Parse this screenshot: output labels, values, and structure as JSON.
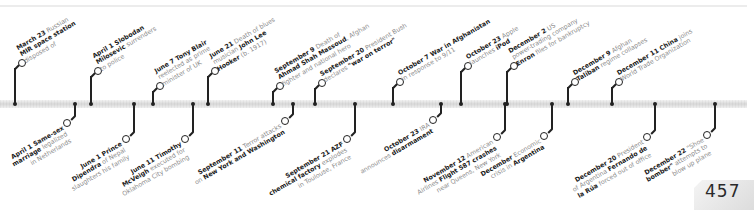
{
  "page": {
    "number": "457"
  },
  "events_above": [
    {
      "date": "March 23",
      "parts": [
        [
          "b",
          "March 23"
        ],
        [
          "t",
          " Russian"
        ],
        [
          "br"
        ],
        [
          "b",
          "MIR space station"
        ],
        [
          "br"
        ],
        [
          "t",
          "disposed of"
        ]
      ]
    },
    {
      "date": "April 1",
      "parts": [
        [
          "b",
          "April 1 Slobodan"
        ],
        [
          "br"
        ],
        [
          "b",
          "Milosevic"
        ],
        [
          "t",
          " surrenders"
        ],
        [
          "br"
        ],
        [
          "t",
          "to police"
        ]
      ]
    },
    {
      "date": "June 7",
      "parts": [
        [
          "b",
          "June 7 Tony Blair"
        ],
        [
          "br"
        ],
        [
          "t",
          "reelected as prime"
        ],
        [
          "br"
        ],
        [
          "t",
          "minister of UK"
        ]
      ]
    },
    {
      "date": "June 21",
      "parts": [
        [
          "b",
          "June 21"
        ],
        [
          "t",
          " Death of blues"
        ],
        [
          "br"
        ],
        [
          "t",
          "musician "
        ],
        [
          "b",
          "John Lee"
        ],
        [
          "br"
        ],
        [
          "b",
          "Hooker"
        ],
        [
          "t",
          " (b. 1917)"
        ]
      ]
    },
    {
      "date": "September 9",
      "parts": [
        [
          "b",
          "September 9"
        ],
        [
          "t",
          " Death of"
        ],
        [
          "br"
        ],
        [
          "b",
          "Ahmad Shah Massoud"
        ],
        [
          "t",
          ", Afghan"
        ],
        [
          "br"
        ],
        [
          "t",
          "fighter and national hero"
        ]
      ]
    },
    {
      "date": "September 20",
      "parts": [
        [
          "b",
          "September 20"
        ],
        [
          "t",
          " President Bush"
        ],
        [
          "br"
        ],
        [
          "t",
          "declares "
        ],
        [
          "b",
          "\"war on terror\""
        ]
      ]
    },
    {
      "date": "October 7",
      "parts": [
        [
          "b",
          "October 7 War in Afghanistan"
        ],
        [
          "br"
        ],
        [
          "t",
          "in response to 9/11"
        ]
      ]
    },
    {
      "date": "October 23",
      "parts": [
        [
          "b",
          "October 23"
        ],
        [
          "t",
          " Apple"
        ],
        [
          "br"
        ],
        [
          "t",
          "launches "
        ],
        [
          "b",
          "iPod"
        ]
      ]
    },
    {
      "date": "December 2",
      "parts": [
        [
          "b",
          "December 2"
        ],
        [
          "t",
          " US"
        ],
        [
          "br"
        ],
        [
          "t",
          "power-trading company"
        ],
        [
          "br"
        ],
        [
          "b",
          "Enron"
        ],
        [
          "t",
          " files for bankruptcy"
        ]
      ]
    },
    {
      "date": "December 9",
      "parts": [
        [
          "b",
          "December 9"
        ],
        [
          "t",
          " Afghan"
        ],
        [
          "br"
        ],
        [
          "b",
          "Taliban"
        ],
        [
          "t",
          " regime collapses"
        ]
      ]
    },
    {
      "date": "December 11",
      "parts": [
        [
          "b",
          "December 11 China"
        ],
        [
          "t",
          " joins"
        ],
        [
          "br"
        ],
        [
          "t",
          "World Trade Organization"
        ]
      ]
    }
  ],
  "events_below": [
    {
      "date": "April 1",
      "parts": [
        [
          "b",
          "April 1 Same-sex"
        ],
        [
          "br"
        ],
        [
          "b",
          "marriage"
        ],
        [
          "t",
          " legalized"
        ],
        [
          "br"
        ],
        [
          "t",
          "in Netherlands"
        ]
      ]
    },
    {
      "date": "June 1",
      "parts": [
        [
          "b",
          "June 1 Prince"
        ],
        [
          "br"
        ],
        [
          "b",
          "Dipendra"
        ],
        [
          "t",
          " of Nepal"
        ],
        [
          "br"
        ],
        [
          "t",
          "slaughters his family"
        ]
      ]
    },
    {
      "date": "June 11",
      "parts": [
        [
          "b",
          "June 11 Timothy"
        ],
        [
          "br"
        ],
        [
          "b",
          "McVeigh"
        ],
        [
          "t",
          " executed for"
        ],
        [
          "br"
        ],
        [
          "t",
          "Oklahoma City bombing"
        ]
      ]
    },
    {
      "date": "September 11",
      "parts": [
        [
          "b",
          "September 11"
        ],
        [
          "t",
          " Terror attacks"
        ],
        [
          "br"
        ],
        [
          "t",
          "on "
        ],
        [
          "b",
          "New York and Washington"
        ]
      ]
    },
    {
      "date": "September 21",
      "parts": [
        [
          "b",
          "September 21 AZF"
        ],
        [
          "br"
        ],
        [
          "b",
          "chemical factory"
        ],
        [
          "t",
          " explodes"
        ],
        [
          "br"
        ],
        [
          "t",
          "in Toulouse, France"
        ]
      ]
    },
    {
      "date": "October 23",
      "parts": [
        [
          "b",
          "October 23"
        ],
        [
          "t",
          " IRA"
        ],
        [
          "br"
        ],
        [
          "t",
          "announces "
        ],
        [
          "b",
          "disarmament"
        ]
      ]
    },
    {
      "date": "November 12",
      "parts": [
        [
          "b",
          "November 12"
        ],
        [
          "t",
          " American"
        ],
        [
          "br"
        ],
        [
          "t",
          "Airlines "
        ],
        [
          "b",
          "Flight 587 crashes"
        ],
        [
          "br"
        ],
        [
          "t",
          "near Queens, New York"
        ]
      ]
    },
    {
      "date": "December",
      "parts": [
        [
          "b",
          "December"
        ],
        [
          "t",
          " Economic"
        ],
        [
          "br"
        ],
        [
          "t",
          "crisis in "
        ],
        [
          "b",
          "Argentina"
        ]
      ]
    },
    {
      "date": "December 20",
      "parts": [
        [
          "b",
          "December 20"
        ],
        [
          "t",
          " President"
        ],
        [
          "br"
        ],
        [
          "t",
          "of Argentina "
        ],
        [
          "b",
          "Fernando de"
        ],
        [
          "br"
        ],
        [
          "b",
          "la Rúa"
        ],
        [
          "t",
          " forced out of office"
        ]
      ]
    },
    {
      "date": "December 22",
      "parts": [
        [
          "b",
          "December 22"
        ],
        [
          "t",
          " \"Shoe"
        ],
        [
          "br"
        ],
        [
          "b",
          "bomber\""
        ],
        [
          "t",
          " attempts to"
        ],
        [
          "br"
        ],
        [
          "t",
          "blow up plane"
        ]
      ]
    }
  ]
}
